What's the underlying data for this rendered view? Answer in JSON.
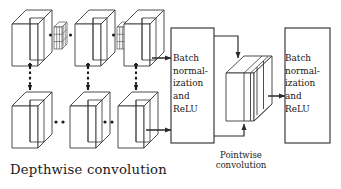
{
  "figure": {
    "type": "diagram",
    "background_color": "#ffffff",
    "stroke_color": "#2b2b2b",
    "text_color": "#161616"
  },
  "labels": {
    "depthwise": "Depthwise convolution",
    "pointwise": "Pointwise convolution"
  },
  "blocks": {
    "bn1": {
      "name": "batch-normalization-relu-1",
      "text": "Batch\nnormal-\nization\nand\nReLU"
    },
    "bn2": {
      "name": "batch-normalization-relu-2",
      "text": "Batch\nnormal-\nization\nand\nReLU"
    }
  },
  "depthwise": {
    "top_row_slab_count": 3,
    "bottom_row_slab_count": 3,
    "kernel_count": 2,
    "kernel_grid": "3x3",
    "ellipsis_groups": 4,
    "vertical_dashed_arrows": 3
  },
  "pointwise": {
    "slab_count": 4,
    "incoming_arrows": 2,
    "outgoing_arrows": 1
  },
  "arrows": {
    "depthwise_top_to_bn1": "solid-right-arrow",
    "depthwise_bottom_to_bn1": "solid-right-arrow",
    "bn1_to_pointwise_top": "elbow-down-arrow",
    "bn1_to_pointwise_bottom": "elbow-up-arrow",
    "pointwise_to_bn2": "solid-right-arrow",
    "top_to_bottom_link": "dashed-down-arrow"
  }
}
